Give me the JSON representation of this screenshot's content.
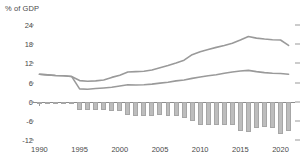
{
  "chart_data": {
    "type": "bar",
    "title": "% of GDP",
    "xlabel": "",
    "ylabel": "% of GDP",
    "ylim": [
      -12,
      24
    ],
    "xlim": [
      1989.2,
      2021.8
    ],
    "grid": false,
    "legend": "none",
    "y_ticks": [
      24,
      18,
      12,
      6,
      0,
      -6,
      -12
    ],
    "y_tick_labels": [
      "24",
      "18",
      "12",
      "6",
      "0",
      "-6",
      "-12"
    ],
    "x_ticks": [
      1990,
      1995,
      2000,
      2005,
      2010,
      2015,
      2020
    ],
    "x_tick_labels": [
      "1990",
      "1995",
      "2000",
      "2005",
      "2010",
      "2015",
      "2020"
    ],
    "x": [
      1990,
      1991,
      1992,
      1993,
      1994,
      1995,
      1996,
      1997,
      1998,
      1999,
      2000,
      2001,
      2002,
      2003,
      2004,
      2005,
      2006,
      2007,
      2008,
      2009,
      2010,
      2011,
      2012,
      2013,
      2014,
      2015,
      2016,
      2017,
      2018,
      2019,
      2020,
      2021
    ],
    "series": [
      {
        "name": "upper-line",
        "type": "line",
        "color": "#9a9a9a",
        "values": [
          8.6,
          8.4,
          8.2,
          8.1,
          7.9,
          6.6,
          6.4,
          6.5,
          6.8,
          7.6,
          8.3,
          9.3,
          9.4,
          9.5,
          9.9,
          10.6,
          11.3,
          12.1,
          13.0,
          14.7,
          15.6,
          16.3,
          17.0,
          17.6,
          18.3,
          19.3,
          20.4,
          19.9,
          19.6,
          19.4,
          19.3,
          17.6
        ]
      },
      {
        "name": "lower-line",
        "type": "line",
        "color": "#9a9a9a",
        "values": [
          8.6,
          8.4,
          8.2,
          8.1,
          7.9,
          4.0,
          3.9,
          4.1,
          4.3,
          4.5,
          4.9,
          5.3,
          5.2,
          5.3,
          5.5,
          5.8,
          6.1,
          6.5,
          6.8,
          7.3,
          7.7,
          8.1,
          8.4,
          8.9,
          9.3,
          9.6,
          9.8,
          9.4,
          9.1,
          8.9,
          8.8,
          8.6
        ]
      },
      {
        "name": "balance-bars",
        "type": "bar",
        "color": "#bdbdbd",
        "values": [
          -0.1,
          -0.2,
          -0.2,
          -0.3,
          -0.3,
          -2.6,
          -2.7,
          -2.6,
          -2.7,
          -2.9,
          -2.8,
          -4.2,
          -4.5,
          -4.6,
          -4.4,
          -4.3,
          -4.5,
          -4.6,
          -5.0,
          -6.0,
          -7.4,
          -7.3,
          -7.2,
          -7.4,
          -7.3,
          -9.3,
          -9.4,
          -8.2,
          -8.0,
          -8.1,
          -10.0,
          -9.2
        ]
      }
    ]
  }
}
